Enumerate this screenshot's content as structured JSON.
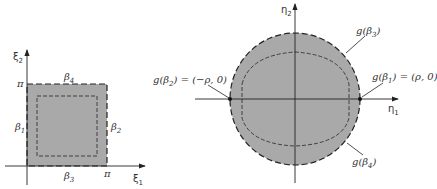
{
  "colors": {
    "fill": "#a9a9a9",
    "stroke": "#222222",
    "dash": "#333333",
    "text": "#333333",
    "background": "#ffffff"
  },
  "left_panel": {
    "x_axis_label": "ξ",
    "x_axis_sub": "1",
    "y_axis_label": "ξ",
    "y_axis_sub": "2",
    "x_tick": "π",
    "y_tick": "π",
    "edges": {
      "left": {
        "sym": "β",
        "sub": "1"
      },
      "right": {
        "sym": "β",
        "sub": "2"
      },
      "bottom": {
        "sym": "β",
        "sub": "3"
      },
      "top": {
        "sym": "β",
        "sub": "4"
      }
    }
  },
  "right_panel": {
    "x_axis_label": "η",
    "x_axis_sub": "1",
    "y_axis_label": "η",
    "y_axis_sub": "2",
    "annotations": {
      "beta3": {
        "pre": "g(β",
        "sub": "3",
        "post": ")"
      },
      "beta4": {
        "pre": "g(β",
        "sub": "4",
        "post": ")"
      },
      "beta1": {
        "pre": "g(β",
        "sub": "1",
        "post": ") = (ρ, 0)"
      },
      "beta2": {
        "pre": "g(β",
        "sub": "2",
        "post": ") = (−ρ, 0)"
      }
    }
  }
}
